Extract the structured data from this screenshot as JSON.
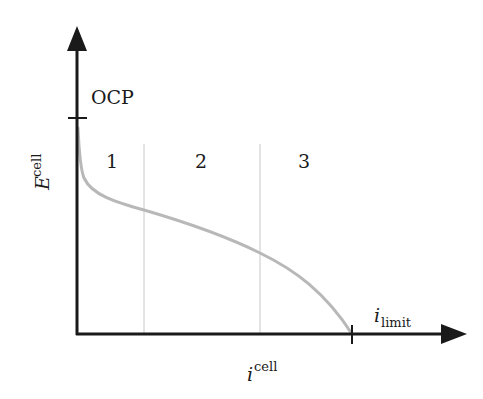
{
  "diagram": {
    "type": "polarization-curve",
    "y_axis": {
      "label_base": "E",
      "label_super": "cell",
      "tick_label": "OCP"
    },
    "x_axis": {
      "label_base": "i",
      "label_super": "cell",
      "tick_label_base": "i",
      "tick_label_sub": "limit"
    },
    "regions": [
      {
        "label": "1"
      },
      {
        "label": "2"
      },
      {
        "label": "3"
      }
    ],
    "colors": {
      "axis": "#1a1a1a",
      "curve": "#b8b8b8",
      "divider": "#c8c8c8",
      "text": "#1a1a1a",
      "background": "#ffffff"
    }
  }
}
